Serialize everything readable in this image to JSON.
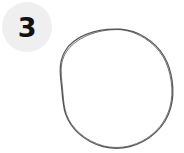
{
  "canvas": {
    "width": 184,
    "height": 153,
    "background_color": "#ffffff"
  },
  "step_badge": {
    "number": "3",
    "background_color": "#efefef",
    "text_color": "#111111",
    "shape": "circle",
    "position": "top-left"
  },
  "drawing": {
    "icon_name": "hand-drawn-circle",
    "shape": "circle",
    "stroke_color": "#5b5b5e",
    "stroke_style": "hand-drawn-wobbly-thin",
    "fill": "none",
    "center_x": 116,
    "center_y": 89,
    "radius_x": 56,
    "radius_y": 60
  }
}
